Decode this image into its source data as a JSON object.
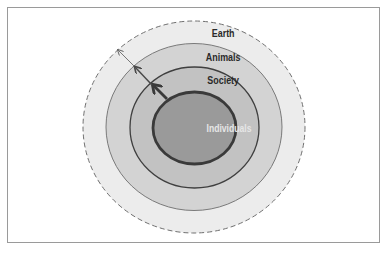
{
  "diagram": {
    "type": "concentric-circles",
    "layers": [
      {
        "id": "earth",
        "label": "Earth",
        "fill": "#ececec",
        "stroke": "#6f6f6f",
        "dashed": true
      },
      {
        "id": "animals",
        "label": "Animals",
        "fill": "#d3d3d3",
        "stroke": "#7a7a7a",
        "dashed": false
      },
      {
        "id": "society",
        "label": "Society",
        "fill": "#c2c2c2",
        "stroke": "#3f3f3f",
        "dashed": false
      },
      {
        "id": "individuals",
        "label": "Individuals",
        "fill": "#9a9a9a",
        "stroke": "#3a3a3a",
        "dashed": false,
        "label_color": "#e6e6e6"
      }
    ],
    "arrows": [
      {
        "from": "individuals",
        "to": "society",
        "weight": "thick"
      },
      {
        "from": "society",
        "to": "animals",
        "weight": "medium"
      },
      {
        "from": "animals",
        "to": "earth",
        "weight": "thin"
      }
    ]
  },
  "labels": {
    "earth": "Earth",
    "animals": "Animals",
    "society": "Society",
    "individuals": "Individuals"
  }
}
